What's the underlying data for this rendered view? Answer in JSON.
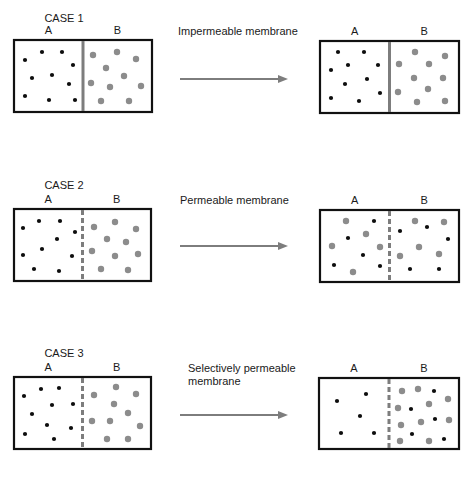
{
  "colors": {
    "box_border": "#111111",
    "membrane": "#7d7d7d",
    "black_particle": "#0d0d0d",
    "gray_particle": "#8c8c8c",
    "arrow": "#7d7d7d"
  },
  "cases": [
    {
      "title": "CASE 1",
      "membrane_label_lines": [
        "Impermeable membrane"
      ],
      "membrane_type": "solid",
      "left_box": {
        "label_a": "A",
        "label_b": "B",
        "x": 14,
        "y": 40,
        "w": 138,
        "h": 72,
        "black": [
          [
            25,
            60
          ],
          [
            42,
            52
          ],
          [
            62,
            52
          ],
          [
            73,
            65
          ],
          [
            32,
            78
          ],
          [
            52,
            75
          ],
          [
            69,
            84
          ],
          [
            25,
            96
          ],
          [
            49,
            100
          ],
          [
            75,
            100
          ]
        ],
        "gray": [
          [
            93,
            55
          ],
          [
            117,
            52
          ],
          [
            136,
            59
          ],
          [
            106,
            68
          ],
          [
            124,
            76
          ],
          [
            91,
            83
          ],
          [
            110,
            87
          ],
          [
            141,
            86
          ],
          [
            101,
            101
          ],
          [
            129,
            101
          ]
        ]
      },
      "right_box": {
        "label_a": "A",
        "label_b": "B",
        "x": 320,
        "y": 41,
        "w": 139,
        "h": 72,
        "black": [
          [
            338,
            52
          ],
          [
            364,
            52
          ],
          [
            331,
            70
          ],
          [
            348,
            65
          ],
          [
            378,
            65
          ],
          [
            345,
            84
          ],
          [
            367,
            79
          ],
          [
            380,
            93
          ],
          [
            331,
            98
          ],
          [
            359,
            101
          ]
        ],
        "gray": [
          [
            415,
            52
          ],
          [
            445,
            56
          ],
          [
            399,
            64
          ],
          [
            429,
            64
          ],
          [
            414,
            78
          ],
          [
            443,
            78
          ],
          [
            398,
            92
          ],
          [
            428,
            89
          ],
          [
            417,
            102
          ],
          [
            445,
            101
          ]
        ]
      },
      "arrow": {
        "x1": 180,
        "x2": 288,
        "y": 79
      }
    },
    {
      "title": "CASE 2",
      "membrane_label_lines": [
        "Permeable membrane"
      ],
      "membrane_type": "dashed",
      "left_box": {
        "label_a": "A",
        "label_b": "B",
        "x": 14,
        "y": 209,
        "w": 137,
        "h": 72,
        "black": [
          [
            23,
            228
          ],
          [
            39,
            221
          ],
          [
            60,
            221
          ],
          [
            75,
            232
          ],
          [
            57,
            239
          ],
          [
            42,
            249
          ],
          [
            23,
            255
          ],
          [
            72,
            256
          ],
          [
            34,
            269
          ],
          [
            59,
            271
          ]
        ],
        "gray": [
          [
            94,
            227
          ],
          [
            115,
            222
          ],
          [
            136,
            229
          ],
          [
            107,
            239
          ],
          [
            126,
            242
          ],
          [
            92,
            251
          ],
          [
            115,
            256
          ],
          [
            138,
            254
          ],
          [
            101,
            269
          ],
          [
            128,
            270
          ]
        ]
      },
      "right_box": {
        "label_a": "A",
        "label_b": "B",
        "x": 320,
        "y": 210,
        "w": 139,
        "h": 72,
        "black": [
          [
            374,
            221
          ],
          [
            348,
            238
          ],
          [
            363,
            255
          ],
          [
            334,
            265
          ],
          [
            380,
            266
          ],
          [
            400,
            231
          ],
          [
            427,
            227
          ],
          [
            448,
            239
          ],
          [
            410,
            269
          ],
          [
            439,
            269
          ]
        ],
        "gray": [
          [
            346,
            221
          ],
          [
            366,
            234
          ],
          [
            332,
            246
          ],
          [
            380,
            247
          ],
          [
            415,
            221
          ],
          [
            444,
            222
          ],
          [
            419,
            247
          ],
          [
            400,
            256
          ],
          [
            439,
            254
          ],
          [
            353,
            272
          ]
        ]
      },
      "arrow": {
        "x1": 180,
        "x2": 288,
        "y": 246
      }
    },
    {
      "title": "CASE 3",
      "membrane_label_lines": [
        "Selectively permeable",
        "membrane"
      ],
      "membrane_type": "dashed",
      "left_box": {
        "label_a": "A",
        "label_b": "B",
        "x": 14,
        "y": 377,
        "w": 137,
        "h": 72,
        "black": [
          [
            24,
            396
          ],
          [
            41,
            389
          ],
          [
            59,
            388
          ],
          [
            73,
            404
          ],
          [
            52,
            405
          ],
          [
            32,
            414
          ],
          [
            47,
            425
          ],
          [
            71,
            428
          ],
          [
            25,
            434
          ],
          [
            54,
            439
          ]
        ],
        "gray": [
          [
            94,
            395
          ],
          [
            116,
            387
          ],
          [
            136,
            394
          ],
          [
            114,
            404
          ],
          [
            128,
            413
          ],
          [
            92,
            421
          ],
          [
            110,
            421
          ],
          [
            140,
            426
          ],
          [
            107,
            439
          ],
          [
            128,
            439
          ]
        ]
      },
      "right_box": {
        "label_a": "A",
        "label_b": "B",
        "x": 319,
        "y": 378,
        "w": 140,
        "h": 71,
        "black": [
          [
            337,
            401
          ],
          [
            366,
            394
          ],
          [
            360,
            416
          ],
          [
            341,
            433
          ],
          [
            374,
            433
          ],
          [
            434,
            391
          ],
          [
            411,
            409
          ],
          [
            435,
            419
          ],
          [
            412,
            434
          ],
          [
            444,
            439
          ]
        ],
        "gray": [
          [
            402,
            391
          ],
          [
            418,
            389
          ],
          [
            448,
            399
          ],
          [
            398,
            408
          ],
          [
            429,
            404
          ],
          [
            401,
            425
          ],
          [
            421,
            422
          ],
          [
            449,
            420
          ],
          [
            400,
            441
          ],
          [
            429,
            441
          ]
        ]
      },
      "arrow": {
        "x1": 180,
        "x2": 288,
        "y": 415
      }
    }
  ]
}
